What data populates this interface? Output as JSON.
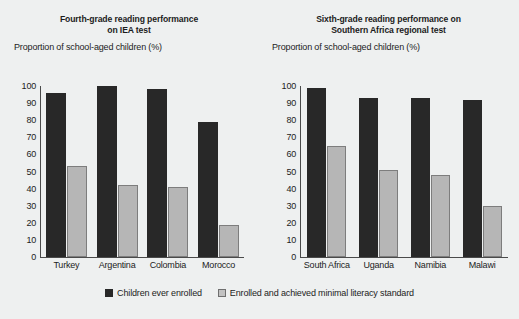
{
  "figure": {
    "background_color": "#eef0f0",
    "series_colors": {
      "dark": "#282828",
      "light": "#b6b6b6"
    }
  },
  "legend": {
    "items": [
      {
        "key": "dark",
        "label": "Children ever enrolled"
      },
      {
        "key": "light",
        "label": "Enrolled and achieved minimal literacy standard"
      }
    ]
  },
  "chart_data": [
    {
      "type": "bar",
      "title": "Fourth-grade reading performance on IEA test",
      "title_line1": "Fourth-grade reading performance",
      "title_line2": "on IEA test",
      "ylabel": "Proportion of school-aged children (%)",
      "xlabel": "",
      "ylim": [
        0,
        100
      ],
      "yticks": [
        100,
        90,
        80,
        70,
        60,
        50,
        40,
        30,
        20,
        10,
        0
      ],
      "grid": false,
      "legend_position": "bottom-center",
      "categories": [
        "Turkey",
        "Argentina",
        "Colombia",
        "Morocco"
      ],
      "series": [
        {
          "name": "Children ever enrolled",
          "values": [
            96,
            100,
            98,
            79
          ]
        },
        {
          "name": "Enrolled and achieved minimal literacy standard",
          "values": [
            53,
            42,
            41,
            19
          ]
        }
      ]
    },
    {
      "type": "bar",
      "title": "Sixth-grade reading performance on Southern Africa regional test",
      "title_line1": "Sixth-grade reading performance on",
      "title_line2": "Southern Africa regional test",
      "ylabel": "Proportion of school-aged children (%)",
      "xlabel": "",
      "ylim": [
        0,
        100
      ],
      "yticks": [
        100,
        90,
        80,
        70,
        60,
        50,
        40,
        30,
        20,
        10,
        0
      ],
      "grid": false,
      "legend_position": "bottom-center",
      "categories": [
        "South Africa",
        "Uganda",
        "Namibia",
        "Malawi"
      ],
      "series": [
        {
          "name": "Children ever enrolled",
          "values": [
            99,
            93,
            93,
            92
          ]
        },
        {
          "name": "Enrolled and achieved minimal literacy standard",
          "values": [
            65,
            51,
            48,
            30
          ]
        }
      ]
    }
  ]
}
